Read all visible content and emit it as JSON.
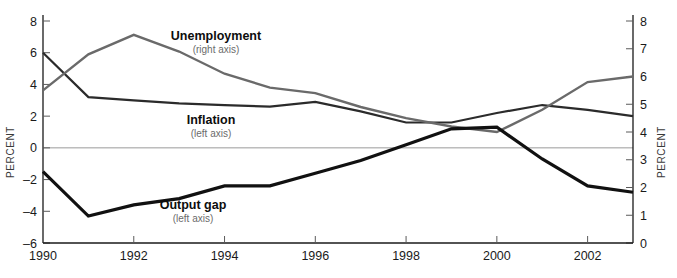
{
  "chart_data": {
    "type": "line",
    "title": "",
    "xlabel": "",
    "ylabel": "PERCENT",
    "ylabel_right": "PERCENT",
    "grid": false,
    "legend": "inline-annotations",
    "x": [
      1990,
      1991,
      1992,
      1993,
      1994,
      1995,
      1996,
      1997,
      1998,
      1999,
      2000,
      2001,
      2002,
      2003
    ],
    "xlim": [
      1990,
      2003
    ],
    "xticks": [
      1990,
      1992,
      1994,
      1996,
      1998,
      2000,
      2002
    ],
    "xtick_labels": [
      "1990",
      "1992",
      "1994",
      "1996",
      "1998",
      "2000",
      "2002"
    ],
    "xticks_minor": [
      1991,
      1993,
      1995,
      1997,
      1999,
      2001,
      2003
    ],
    "ylim": [
      -6,
      8
    ],
    "yticks": [
      -6,
      -4,
      -2,
      0,
      2,
      4,
      6,
      8
    ],
    "ytick_labels": [
      "-6",
      "-4",
      "-2",
      "0",
      "2",
      "4",
      "6",
      "8"
    ],
    "ylim_right": [
      0,
      8
    ],
    "yticks_right": [
      0,
      1,
      2,
      3,
      4,
      5,
      6,
      7,
      8
    ],
    "ytick_labels_right": [
      "0",
      "1",
      "2",
      "3",
      "4",
      "5",
      "6",
      "7",
      "8"
    ],
    "series": [
      {
        "name": "Inflation",
        "axis": "left",
        "color": "#2b2b2b",
        "width": 2.2,
        "label": "Inflation",
        "sublabel": "(left axis)",
        "values": [
          6.0,
          3.2,
          3.0,
          2.8,
          2.7,
          2.6,
          2.9,
          2.3,
          1.6,
          1.6,
          2.2,
          2.7,
          2.4,
          2.0
        ]
      },
      {
        "name": "Unemployment",
        "axis": "right",
        "color": "#6a6a6a",
        "width": 2.4,
        "label": "Unemployment",
        "sublabel": "(right axis)",
        "values": [
          5.5,
          6.8,
          7.5,
          6.9,
          6.1,
          5.6,
          5.4,
          4.9,
          4.5,
          4.2,
          4.0,
          4.8,
          5.8,
          6.0
        ]
      },
      {
        "name": "Output gap",
        "axis": "left",
        "color": "#111111",
        "width": 3.2,
        "label": "Output gap",
        "sublabel": "(left axis)",
        "values": [
          -1.5,
          -4.3,
          -3.6,
          -3.2,
          -2.4,
          -2.4,
          -1.6,
          -0.8,
          0.2,
          1.2,
          1.3,
          -0.7,
          -2.4,
          -2.8
        ]
      }
    ],
    "annotations": [
      {
        "text": "Unemployment",
        "sub": "(right axis)",
        "x": 216,
        "y": 40
      },
      {
        "text": "Inflation",
        "sub": "(left axis)",
        "x": 211,
        "y": 124
      },
      {
        "text": "Output gap",
        "sub": "(left axis)",
        "x": 193,
        "y": 209
      }
    ],
    "zero_line_value": 0,
    "colors": {
      "inflation": "#2b2b2b",
      "unemployment": "#6a6a6a",
      "output_gap": "#111111",
      "axis": "#1a1a1a",
      "zero_line": "#9a9a9a",
      "background": "#ffffff"
    }
  }
}
